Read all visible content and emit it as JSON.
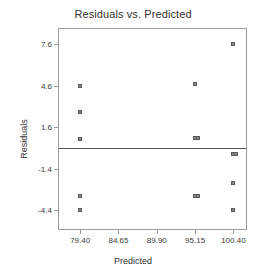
{
  "chart_data": {
    "type": "scatter",
    "title": "Residuals vs. Predicted",
    "xlabel": "Predicted",
    "ylabel": "Residuals",
    "xlim": [
      76.5,
      102.4
    ],
    "ylim": [
      -5.9,
      8.7
    ],
    "xticks": [
      "79.40",
      "84.65",
      "89.90",
      "95.15",
      "100.40"
    ],
    "xtick_values": [
      79.4,
      84.65,
      89.9,
      95.15,
      100.4
    ],
    "yticks": [
      "7.6",
      "4.6",
      "1.6",
      "-1.4",
      "-4.4"
    ],
    "ytick_values": [
      7.6,
      4.6,
      1.6,
      -1.4,
      -4.4
    ],
    "grid": false,
    "legend": null,
    "reference_line": {
      "orientation": "horizontal",
      "y": 0.1
    },
    "points": [
      {
        "x": 79.4,
        "y": 4.6
      },
      {
        "x": 79.4,
        "y": 2.7
      },
      {
        "x": 79.4,
        "y": 0.75
      },
      {
        "x": 79.4,
        "y": -3.4
      },
      {
        "x": 79.4,
        "y": -4.4
      },
      {
        "x": 95.15,
        "y": 4.75
      },
      {
        "x": 95.15,
        "y": 0.8
      },
      {
        "x": 95.5,
        "y": 0.8
      },
      {
        "x": 95.15,
        "y": -3.4
      },
      {
        "x": 95.5,
        "y": -3.4
      },
      {
        "x": 100.4,
        "y": 7.6
      },
      {
        "x": 100.4,
        "y": -0.3
      },
      {
        "x": 100.75,
        "y": -0.3
      },
      {
        "x": 100.4,
        "y": -2.4
      },
      {
        "x": 100.4,
        "y": -4.4
      }
    ]
  }
}
